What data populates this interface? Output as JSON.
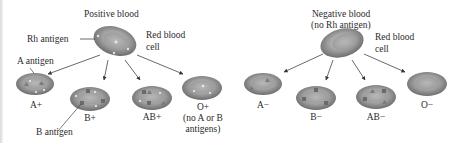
{
  "positive": {
    "title": "Positive blood",
    "parent_labels": {
      "rh": "Rh antigen",
      "rbc_1": "Red blood",
      "rbc_2": "cell"
    },
    "callouts": {
      "a_antigen": "A antigen",
      "b_antigen": "B antigen"
    },
    "types": [
      {
        "label": "A+",
        "antigens": [
          "A"
        ]
      },
      {
        "label": "B+",
        "antigens": [
          "B"
        ]
      },
      {
        "label": "AB+",
        "antigens": [
          "A",
          "B"
        ]
      },
      {
        "label": "O+",
        "note_1": "(no A or B",
        "note_2": "antigens)",
        "antigens": []
      }
    ]
  },
  "negative": {
    "title_1": "Negative blood",
    "title_2": "(no Rh antigen)",
    "parent_labels": {
      "rbc_1": "Red blood",
      "rbc_2": "cell"
    },
    "types": [
      {
        "label": "A−",
        "antigens": [
          "A"
        ]
      },
      {
        "label": "B−",
        "antigens": [
          "B"
        ]
      },
      {
        "label": "AB−",
        "antigens": [
          "A",
          "B"
        ]
      },
      {
        "label": "O−",
        "antigens": []
      }
    ]
  },
  "colors": {
    "cell_dark": "#6e6e6e",
    "cell_mid": "#9a9a9a",
    "cell_light": "#cfcfcf",
    "line": "#444444"
  }
}
